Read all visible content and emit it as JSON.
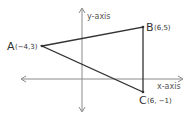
{
  "diagram": {
    "type": "coordinate-plane-triangle",
    "axes": {
      "x_label": "x-axis",
      "y_label": "y-axis"
    },
    "points": [
      {
        "name": "A",
        "coords": "(−4,3)"
      },
      {
        "name": "B",
        "coords": "(6,5)"
      },
      {
        "name": "C",
        "coords": "(6, −1)"
      }
    ],
    "colors": {
      "axis": "#888888",
      "triangle": "#333333",
      "text": "#333333"
    }
  }
}
